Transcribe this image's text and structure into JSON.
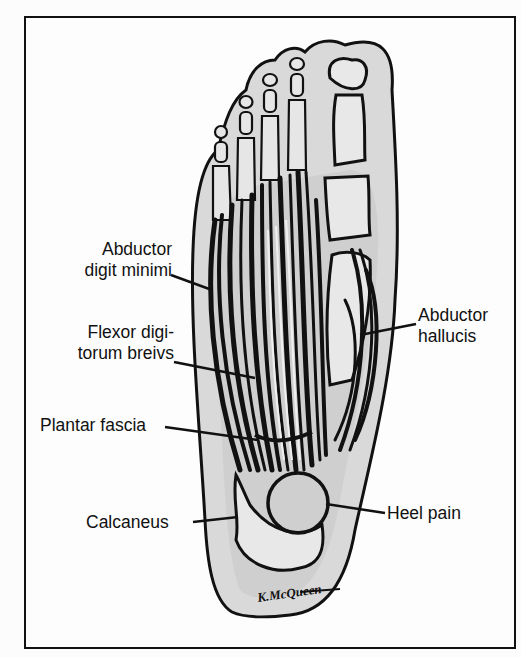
{
  "figure": {
    "labels": {
      "abductor_digiti_minimi": [
        "Abductor",
        "digit minimi"
      ],
      "flexor_digitorum_brevis": [
        "Flexor digi-",
        "torum breivs"
      ],
      "plantar_fascia": "Plantar fascia",
      "calcaneus": "Calcaneus",
      "abductor_hallucis": [
        "Abductor",
        "hallucis"
      ],
      "heel_pain": "Heel pain"
    },
    "signature": "K.McQueen",
    "colors": {
      "ink": "#111111",
      "tint": "#d6d6d6",
      "paper": "#fdfdfd"
    }
  }
}
